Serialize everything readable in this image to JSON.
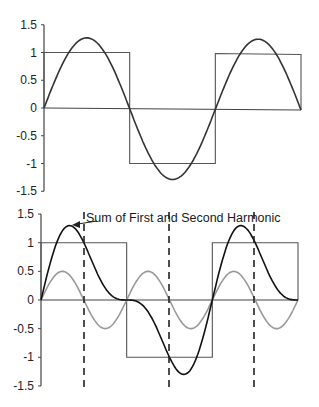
{
  "chart_data": [
    {
      "type": "line",
      "title": "",
      "xlabel": "",
      "ylabel": "",
      "ylim": [
        -1.5,
        1.5
      ],
      "yticks": [
        "1.5",
        "1",
        "0.5",
        "0",
        "-0.5",
        "-1",
        "-1.5"
      ],
      "ytick_values": [
        1.5,
        1,
        0.5,
        0,
        -0.5,
        -1,
        -1.5
      ],
      "grid": false,
      "x_domain": [
        0,
        6.2832
      ],
      "series": [
        {
          "name": "Square wave",
          "kind": "square",
          "amplitude": 1.0,
          "color": "#555555"
        },
        {
          "name": "First harmonic",
          "kind": "sin",
          "harmonic": 1,
          "amplitude": 1.27,
          "color": "#333333"
        }
      ]
    },
    {
      "type": "line",
      "title": "",
      "xlabel": "",
      "ylabel": "",
      "ylim": [
        -1.5,
        1.5
      ],
      "yticks": [
        "1.5",
        "1",
        "0.5",
        "0",
        "-0.5",
        "-1",
        "-1.5"
      ],
      "ytick_values": [
        1.5,
        1,
        0.5,
        0,
        -0.5,
        -1,
        -1.5
      ],
      "grid": false,
      "x_domain": [
        0,
        6.2832
      ],
      "series": [
        {
          "name": "Square wave",
          "kind": "square",
          "amplitude": 1.0,
          "color": "#555555"
        },
        {
          "name": "Second harmonic",
          "kind": "sin",
          "harmonic": 2,
          "amplitude": 0.5,
          "color": "#999999"
        },
        {
          "name": "Sum of First and Second Harmonic",
          "kind": "sum",
          "terms": [
            [
              1,
              1.0
            ],
            [
              2,
              0.5
            ]
          ],
          "color": "#111111"
        }
      ],
      "vertical_dashed_lines_x": [
        1.05,
        3.14,
        5.23
      ],
      "annotations": [
        {
          "text": "Sum of First and Second Harmonic",
          "points_to": "peak of sum curve (≈1.3)"
        }
      ]
    }
  ]
}
